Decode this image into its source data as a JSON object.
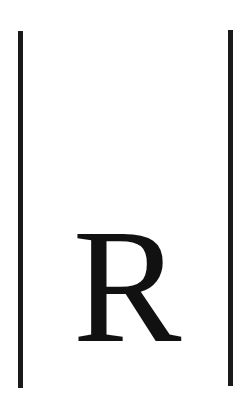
{
  "symbol": {
    "letter": "R",
    "description": "Letter R enclosed between two vertical bars (absolute value / norm notation)"
  },
  "colors": {
    "background": "#ffffff",
    "ink": "#111111",
    "bars": "#1a1a1a"
  }
}
